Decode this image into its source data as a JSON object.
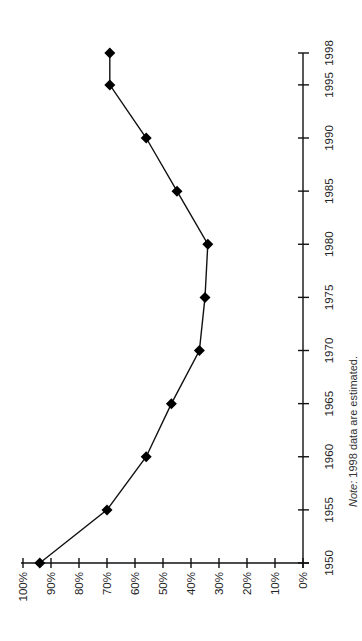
{
  "chart_data": {
    "type": "line",
    "title": "",
    "xlabel": "",
    "ylabel": "",
    "orientation_note": "Figure is rotated 90 degrees counter-clockwise: years run along the right-hand vertical axis (bottom to top), percentages along the bottom axis (right to left).",
    "x": [
      1950,
      1955,
      1960,
      1965,
      1970,
      1975,
      1980,
      1985,
      1990,
      1995,
      1998
    ],
    "series": [
      {
        "name": "Percentage",
        "marker": "diamond",
        "color": "#000000",
        "values": [
          94,
          70,
          56,
          47,
          37,
          35,
          34,
          45,
          56,
          69,
          69
        ]
      }
    ],
    "x_tick_labels": [
      "1950",
      "1955",
      "1960",
      "1965",
      "1970",
      "1975",
      "1980",
      "1985",
      "1990",
      "1995",
      "1998"
    ],
    "y_tick_labels": [
      "0%",
      "10%",
      "20%",
      "30%",
      "40%",
      "50%",
      "60%",
      "70%",
      "80%",
      "90%",
      "100%"
    ],
    "y_ticks": [
      0,
      10,
      20,
      30,
      40,
      50,
      60,
      70,
      80,
      90,
      100
    ],
    "xlim": [
      1950,
      1998
    ],
    "ylim": [
      0,
      100
    ],
    "grid": false,
    "legend": "none",
    "annotations": [
      "Note: 1998 data are estimated."
    ]
  },
  "note": {
    "prefix": "Note:",
    "text": " 1998 data are estimated."
  },
  "colors": {
    "axis": "#111111",
    "series": "#000000",
    "text": "#222222",
    "background": "#ffffff"
  }
}
